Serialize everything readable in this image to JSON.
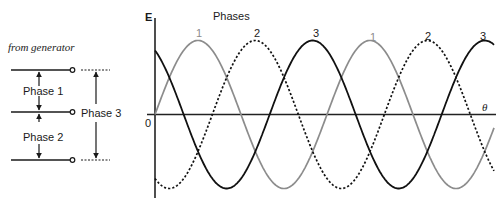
{
  "generator_diagram": {
    "caption": "from generator",
    "phase_labels": [
      "Phase 1",
      "Phase 2",
      "Phase 3"
    ]
  },
  "graph": {
    "title": "Phases",
    "y_axis_label": "E",
    "x_axis_label": "θ",
    "origin_label": "0",
    "peak_labels": [
      "1",
      "2",
      "3",
      "1",
      "2",
      "3"
    ]
  },
  "chart_data": {
    "type": "line",
    "title": "Phases",
    "xlabel": "θ",
    "ylabel": "E",
    "series": [
      {
        "name": "Phase 1",
        "style": "solid gray",
        "phase_offset_deg": 0,
        "peaks_at_deg": [
          90,
          450
        ]
      },
      {
        "name": "Phase 2",
        "style": "dashed black",
        "phase_offset_deg": -120,
        "peaks_at_deg": [
          210,
          570
        ]
      },
      {
        "name": "Phase 3",
        "style": "solid black",
        "phase_offset_deg": -240,
        "peaks_at_deg": [
          330,
          690
        ]
      }
    ],
    "x_range_deg": [
      0,
      720
    ],
    "y_range": [
      -1,
      1
    ],
    "origin": "0",
    "grid": false,
    "legend": "inline peak labels 1, 2, 3"
  },
  "colors": {
    "phase1": "#8c8c8c",
    "phase2": "#111111",
    "phase3": "#111111",
    "axis": "#222222"
  }
}
